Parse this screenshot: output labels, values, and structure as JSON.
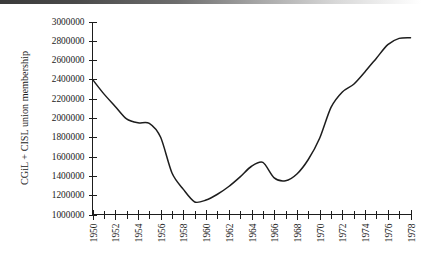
{
  "chart_data": {
    "type": "line",
    "title": "",
    "subtitle": "",
    "xlabel": "",
    "ylabel": "CGiL + CISL union membership",
    "xlim": [
      1950,
      1978
    ],
    "ylim": [
      1000000,
      3000000
    ],
    "grid": false,
    "legend": false,
    "legend_position": "none",
    "line_color": "#1d1d1d",
    "x_tick_step_minor": 1,
    "x_tick_step_labeled": 2,
    "y_tick_step": 200000,
    "x_tick_labels": [
      "1950",
      "1952",
      "1954",
      "1956",
      "1958",
      "1960",
      "1962",
      "1964",
      "1966",
      "1968",
      "1970",
      "1972",
      "1974",
      "1976",
      "1978"
    ],
    "y_tick_labels": [
      "1000000",
      "1200000",
      "1400000",
      "1600000",
      "1800000",
      "2000000",
      "2200000",
      "2400000",
      "2600000",
      "2800000",
      "3000000"
    ],
    "x": [
      1950,
      1951,
      1952,
      1953,
      1954,
      1955,
      1956,
      1957,
      1958,
      1959,
      1960,
      1961,
      1962,
      1963,
      1964,
      1965,
      1966,
      1967,
      1968,
      1969,
      1970,
      1971,
      1972,
      1973,
      1974,
      1975,
      1976,
      1977,
      1978
    ],
    "values": [
      2400000,
      2250000,
      2120000,
      1990000,
      1950000,
      1945000,
      1800000,
      1430000,
      1260000,
      1130000,
      1150000,
      1210000,
      1290000,
      1390000,
      1500000,
      1540000,
      1380000,
      1350000,
      1420000,
      1570000,
      1790000,
      2110000,
      2270000,
      2350000,
      2480000,
      2620000,
      2760000,
      2825000,
      2832000
    ],
    "series": [
      {
        "name": "CGiL + CISL union membership",
        "values": [
          2400000,
          2250000,
          2120000,
          1990000,
          1950000,
          1945000,
          1800000,
          1430000,
          1260000,
          1130000,
          1150000,
          1210000,
          1290000,
          1390000,
          1500000,
          1540000,
          1380000,
          1350000,
          1420000,
          1570000,
          1790000,
          2110000,
          2270000,
          2350000,
          2480000,
          2620000,
          2760000,
          2825000,
          2832000
        ]
      }
    ],
    "annotations": []
  },
  "figure": {
    "axis_color": "#1d1d1d",
    "background": "#ffffff"
  }
}
